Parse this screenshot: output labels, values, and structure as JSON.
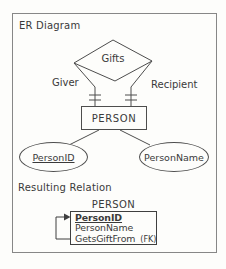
{
  "diagram": {
    "section_title": "ER Diagram",
    "relationship": {
      "label": "Gifts"
    },
    "roles": {
      "left": "Giver",
      "right": "Recipient"
    },
    "entity": {
      "label": "PERSON"
    },
    "attributes": {
      "left": "PersonID",
      "right": "PersonName"
    }
  },
  "relation": {
    "section_title": "Resulting Relation",
    "table_title": "PERSON",
    "rows": [
      {
        "name": "PersonID"
      },
      {
        "name": "PersonName"
      },
      {
        "name": "GetsGiftFrom",
        "suffix": "(FK)"
      }
    ]
  },
  "colors": {
    "line": "#4d4d4d",
    "text": "#3a3a3a",
    "frame_border": "#878787",
    "background": "#fdfdfb"
  }
}
